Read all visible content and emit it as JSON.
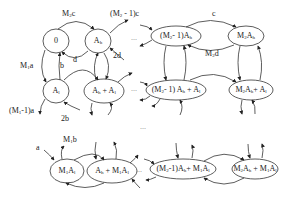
{
  "diagram": {
    "type": "state-transition",
    "nodes": [
      {
        "id": "n0",
        "label": "0"
      },
      {
        "id": "nAh",
        "label": "A_h"
      },
      {
        "id": "nAl",
        "label": "A_l"
      },
      {
        "id": "nAhAl",
        "label": "A_h + A_l"
      },
      {
        "id": "nM2m1Ah",
        "label": "(M_2-1)A_h"
      },
      {
        "id": "nM2Ah",
        "label": "M_2A_h"
      },
      {
        "id": "nM2m1AhAl",
        "label": "(M_2-1) A_h + A_l"
      },
      {
        "id": "nM2AhAl",
        "label": "M_2A_h + A_l"
      },
      {
        "id": "nM1Al",
        "label": "M_1A_l"
      },
      {
        "id": "nAhM1Al",
        "label": "A_h + M_1A_l"
      },
      {
        "id": "nM2m1AhM1Al",
        "label": "(M_2-1)A_h + M_1A_l"
      },
      {
        "id": "nM2AhM1Al",
        "label": "M_2A_h + M_1A_l"
      }
    ],
    "edge_labels": {
      "m2c": "M_2c",
      "m2m1c": "(M_2 - 1)c",
      "c": "c",
      "m1a": "M_1a",
      "b": "b",
      "d": "d",
      "two_d": "2d",
      "m2d": "M_2d",
      "m1m1a": "(M_1-1)a",
      "two_b": "2b",
      "a": "a",
      "m1b": "M_1b"
    },
    "ellipsis": "..."
  }
}
